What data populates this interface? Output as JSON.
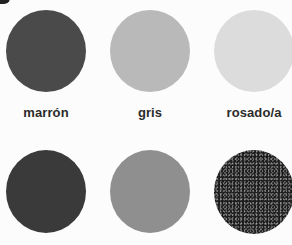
{
  "page": {
    "type": "color-vocabulary-swatches",
    "language": "es"
  },
  "swatches": [
    {
      "label": "marrón",
      "color": "#4a4a4a",
      "row": 1,
      "col": 1
    },
    {
      "label": "gris",
      "color": "#b9b9b9",
      "row": 1,
      "col": 2
    },
    {
      "label": "rosado/a",
      "color": "#dcdcdc",
      "row": 1,
      "col": 3
    },
    {
      "label": "",
      "color": "#3a3a3a",
      "row": 2,
      "col": 1
    },
    {
      "label": "",
      "color": "#8f8f8f",
      "row": 2,
      "col": 2
    },
    {
      "label": "",
      "color": "#1c1c1c",
      "row": 2,
      "col": 3,
      "texture": "speckled"
    }
  ],
  "labels": {
    "s1": "marrón",
    "s2": "gris",
    "s3": "rosado/a"
  },
  "colors": {
    "background": "#fcfcfc",
    "text": "#2b2b2b"
  }
}
